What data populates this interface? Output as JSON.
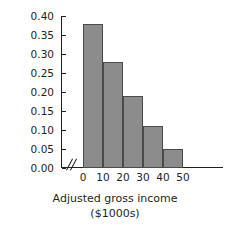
{
  "chart_data": {
    "type": "bar",
    "title": "",
    "xlabel": "Adjusted gross income",
    "xlabel_units": "($1000s)",
    "ylabel": "Relative frequency",
    "categories": [
      "0-10",
      "10-20",
      "20-30",
      "30-40",
      "40-50"
    ],
    "bin_edges": [
      0,
      10,
      20,
      30,
      40,
      50
    ],
    "values": [
      0.38,
      0.28,
      0.19,
      0.11,
      0.05
    ],
    "xlim": [
      0,
      50
    ],
    "ylim": [
      0.0,
      0.4
    ],
    "ytick_labels": [
      "0.40",
      "0.35",
      "0.30",
      "0.25",
      "0.20",
      "0.15",
      "0.10",
      "0.05",
      "0.00"
    ],
    "ytick_values": [
      0.4,
      0.35,
      0.3,
      0.25,
      0.2,
      0.15,
      0.1,
      0.05,
      0.0
    ],
    "xtick_labels": [
      "0",
      "10",
      "20",
      "30",
      "40",
      "50"
    ],
    "xtick_values": [
      0,
      10,
      20,
      30,
      40,
      50
    ],
    "grid": false,
    "legend": null,
    "axis_break": "//",
    "bar_color": "#8c8c8c",
    "bar_border_color": "#4a4a4a",
    "axis_color": "#231f20"
  }
}
